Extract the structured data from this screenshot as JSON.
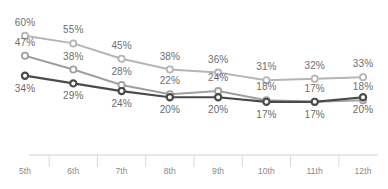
{
  "chart_data": {
    "type": "line",
    "title": "",
    "subtitle": "",
    "xlabel": "",
    "ylabel": "",
    "ylim": [
      0,
      65
    ],
    "grid": false,
    "legend": "none",
    "value_suffix": "%",
    "categories": [
      "5th",
      "6th",
      "7th",
      "8th",
      "9th",
      "10th",
      "11th",
      "12th"
    ],
    "series": [
      {
        "name": "series-light",
        "color": "#b5b5b5",
        "marker": "open-circle",
        "label_position": "above",
        "values": [
          60,
          55,
          45,
          38,
          36,
          31,
          32,
          33
        ],
        "labels": [
          "60%",
          "55%",
          "45%",
          "38%",
          "36%",
          "31%",
          "32%",
          "33%"
        ]
      },
      {
        "name": "series-medium",
        "color": "#a0a0a0",
        "marker": "open-circle",
        "label_position": "above",
        "values": [
          47,
          38,
          28,
          22,
          24,
          18,
          17,
          18
        ],
        "labels": [
          "47%",
          "38%",
          "28%",
          "22%",
          "24%",
          "18%",
          "17%",
          "18%"
        ]
      },
      {
        "name": "series-dark",
        "color": "#4a4a4a",
        "marker": "open-circle-dark",
        "label_position": "below",
        "values": [
          34,
          29,
          24,
          20,
          20,
          17,
          17,
          20
        ],
        "labels": [
          "34%",
          "29%",
          "24%",
          "20%",
          "20%",
          "17%",
          "17%",
          "20%"
        ]
      }
    ]
  },
  "axis": {
    "line_color": "#d0d0d0",
    "tick_color": "#d8d8d8"
  }
}
